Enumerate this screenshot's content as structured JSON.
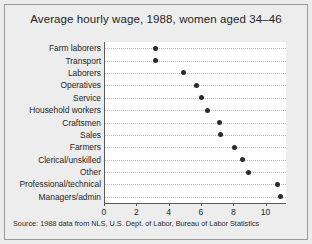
{
  "chart_data": {
    "type": "scatter",
    "title": "Average hourly wage, 1988, women aged 34–46",
    "subtitle": "",
    "xlabel": "",
    "ylabel": "",
    "xlim": [
      0,
      11.2
    ],
    "xticks": [
      0,
      2,
      4,
      6,
      8,
      10
    ],
    "xtick_labels": [
      "0",
      "2",
      "4",
      "6",
      "8",
      "10"
    ],
    "grid": "horizontal-dotted",
    "legend": "none",
    "orientation": "horizontal-dotplot",
    "categories": [
      "Farm laborers",
      "Transport",
      "Laborers",
      "Operatives",
      "Service",
      "Household workers",
      "Craftsmen",
      "Sales",
      "Farmers",
      "Clerical/unskilled",
      "Other",
      "Professional/technical",
      "Managers/admin"
    ],
    "values": [
      3.1,
      3.1,
      4.85,
      5.65,
      5.95,
      6.35,
      7.1,
      7.15,
      8.0,
      8.5,
      8.85,
      10.65,
      10.85
    ],
    "marker": "filled-circle",
    "marker_color": "#2b2b2b",
    "note": "Source:  1988 data from NLS, U.S. Dept. of Labor, Bureau of Labor Statistics"
  },
  "figure": {
    "background_color": "#ededee",
    "plot_background_color": "#ffffff",
    "axis_color": "#5a5a5a",
    "grid_color": "#b8b8b8"
  }
}
